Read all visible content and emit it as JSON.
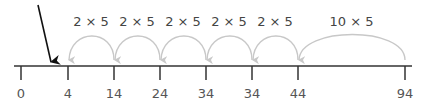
{
  "diagram": {
    "type": "number-line",
    "colors": {
      "axis": "#333333",
      "arc": "#c8c8c8",
      "pointer_arrow": "#111111",
      "label": "#555555"
    },
    "ticks": [
      {
        "label": "0",
        "x": 21
      },
      {
        "label": "4",
        "x": 68
      },
      {
        "label": "14",
        "x": 114
      },
      {
        "label": "24",
        "x": 160
      },
      {
        "label": "34",
        "x": 206
      },
      {
        "label": "34",
        "x": 252
      },
      {
        "label": "44",
        "x": 298
      },
      {
        "label": "94",
        "x": 405
      }
    ],
    "jumps": [
      {
        "label": "2 × 5",
        "from_x": 114,
        "to_x": 68
      },
      {
        "label": "2 × 5",
        "from_x": 160,
        "to_x": 114
      },
      {
        "label": "2 × 5",
        "from_x": 206,
        "to_x": 160
      },
      {
        "label": "2 × 5",
        "from_x": 252,
        "to_x": 206
      },
      {
        "label": "2 × 5",
        "from_x": 298,
        "to_x": 252
      },
      {
        "label": "10 × 5",
        "from_x": 405,
        "to_x": 298
      }
    ],
    "pointer_arrow": {
      "x1": 38,
      "y1": 5,
      "x2": 51,
      "y2": 62
    }
  }
}
